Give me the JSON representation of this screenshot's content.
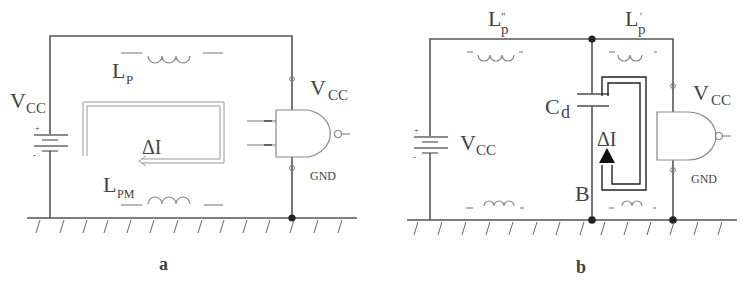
{
  "figure": {
    "panels": [
      {
        "id": "a",
        "caption": "a",
        "labels": {
          "vcc_supply": "V",
          "vcc_supply_sub": "CC",
          "vcc_gate": "V",
          "vcc_gate_sub": "CC",
          "lp": "L",
          "lp_sub": "P",
          "lpm": "L",
          "lpm_sub": "PM",
          "delta_i": "ΔI",
          "gnd": "GND",
          "battery_plus": "+",
          "battery_minus": "-"
        },
        "components": [
          "battery",
          "power-inductor-Lp",
          "ground-inductor-Lpm",
          "nand-gate",
          "current-loop-arrow"
        ]
      },
      {
        "id": "b",
        "caption": "b",
        "labels": {
          "lp_double": "L",
          "lp_double_sub": "p",
          "lp_double_mark": "\"",
          "lp_single": "L",
          "lp_single_sub": "p",
          "lp_single_mark": "'",
          "cd": "C",
          "cd_sub": "d",
          "vcc_supply": "V",
          "vcc_supply_sub": "CC",
          "vcc_gate": "V",
          "vcc_gate_sub": "CC",
          "delta_i": "ΔI",
          "gnd": "GND",
          "node_b": "B",
          "battery_plus": "+",
          "battery_minus": "-"
        },
        "components": [
          "battery",
          "inductor-Lp-double-prime",
          "inductor-Lp-prime",
          "decoupling-capacitor-Cd",
          "nand-gate",
          "current-loop-arrow",
          "ground-inductors"
        ]
      }
    ]
  }
}
